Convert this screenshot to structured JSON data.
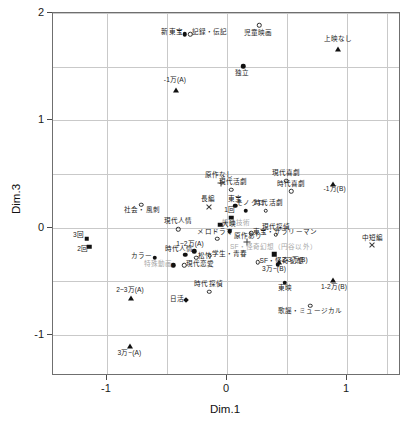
{
  "chart_data": {
    "type": "scatter",
    "title": "",
    "xlabel": "Dim.1",
    "ylabel": "Dim.3",
    "xlim": [
      -1.45,
      1.45
    ],
    "ylim": [
      -1.38,
      2.0
    ],
    "xticks": [
      -1,
      0,
      1
    ],
    "xticklabels": [
      "-1",
      "0",
      "1"
    ],
    "yticks": [
      -1,
      0,
      1,
      2
    ],
    "yticklabels": [
      "-1",
      "0",
      "1",
      "2"
    ],
    "grid": true,
    "gridlines_x": [
      -1.0,
      -0.5,
      0.0,
      0.5,
      1.0,
      1.33
    ],
    "gridlines_y": [
      -1.0,
      -0.5,
      0.0,
      0.5,
      1.0,
      1.5,
      2.0
    ],
    "legend": "none",
    "points": [
      {
        "label": "新東宝",
        "x": -0.345,
        "y": 1.795,
        "marker": "fdot",
        "anchor": "r",
        "lx": -0.36,
        "ly": 1.8
      },
      {
        "label": "記録・伝記",
        "x": -0.3,
        "y": 1.795,
        "marker": "circle",
        "anchor": "l",
        "lx": -0.285,
        "ly": 1.8
      },
      {
        "label": "児童映画",
        "x": 0.275,
        "y": 1.875,
        "marker": "circle",
        "anchor": "c",
        "lx": 0.265,
        "ly": 1.795
      },
      {
        "label": "上映なし",
        "x": 0.935,
        "y": 1.655,
        "marker": "tri",
        "anchor": "c",
        "lx": 0.935,
        "ly": 1.735
      },
      {
        "label": "独立",
        "x": 0.145,
        "y": 1.495,
        "marker": "fdot",
        "anchor": "c",
        "lx": 0.135,
        "ly": 1.425
      },
      {
        "label": "-1万(A)",
        "x": -0.42,
        "y": 1.275,
        "marker": "tri",
        "anchor": "c",
        "lx": -0.425,
        "ly": 1.355
      },
      {
        "label": "原作なし",
        "x": -0.04,
        "y": 0.41,
        "marker": "plus",
        "anchor": "c",
        "lx": -0.06,
        "ly": 0.47
      },
      {
        "label": "現代活劇",
        "x": 0.045,
        "y": 0.345,
        "marker": "circle",
        "anchor": "c",
        "lx": 0.06,
        "ly": 0.405
      },
      {
        "label": "現代喜劇",
        "x": 0.5,
        "y": 0.43,
        "marker": "circle",
        "anchor": "c",
        "lx": 0.5,
        "ly": 0.49
      },
      {
        "label": "時代喜劇",
        "x": 0.545,
        "y": 0.33,
        "marker": "circle",
        "anchor": "c",
        "lx": 0.545,
        "ly": 0.39
      },
      {
        "label": "-1万(B)",
        "x": 0.895,
        "y": 0.4,
        "marker": "tri",
        "anchor": "c",
        "lx": 0.905,
        "ly": 0.345
      },
      {
        "label": "社会・風刺",
        "x": -0.705,
        "y": 0.205,
        "marker": "circle",
        "anchor": "c",
        "lx": -0.7,
        "ly": 0.145
      },
      {
        "label": "長編",
        "x": -0.145,
        "y": 0.185,
        "marker": "cross",
        "anchor": "c",
        "lx": -0.15,
        "ly": 0.245
      },
      {
        "label": "東宝",
        "x": 0.075,
        "y": 0.195,
        "marker": "fdot",
        "anchor": "c",
        "lx": 0.072,
        "ly": 0.25
      },
      {
        "label": "モノクロ",
        "x": 0.165,
        "y": 0.15,
        "marker": "fdot",
        "anchor": "c",
        "lx": 0.205,
        "ly": 0.215
      },
      {
        "label": "時代活劇",
        "x": 0.33,
        "y": 0.15,
        "marker": "circle",
        "anchor": "c",
        "lx": 0.355,
        "ly": 0.215
      },
      {
        "label": "1回",
        "x": 0.045,
        "y": 0.085,
        "marker": "square",
        "anchor": "c",
        "lx": 0.03,
        "ly": 0.15
      },
      {
        "label": "現代人情",
        "x": -0.4,
        "y": -0.025,
        "marker": "circle",
        "anchor": "c",
        "lx": -0.4,
        "ly": 0.04
      },
      {
        "label": "特殊技術",
        "x": -0.05,
        "y": 0.02,
        "marker": "square",
        "anchor": "l",
        "lx": -0.035,
        "ly": 0.025,
        "gray": true
      },
      {
        "label": "大映",
        "x": 0.03,
        "y": -0.04,
        "marker": "fdot",
        "anchor": "c",
        "lx": 0.025,
        "ly": 0.02
      },
      {
        "label": "東宝・サラリーマン",
        "x": 0.21,
        "y": -0.06,
        "marker": "circle",
        "anchor": "l",
        "lx": 0.225,
        "ly": -0.06
      },
      {
        "label": "現代探偵",
        "x": 0.415,
        "y": -0.075,
        "marker": "circle",
        "anchor": "c",
        "lx": 0.415,
        "ly": -0.015
      },
      {
        "label": "3回",
        "x": -1.16,
        "y": -0.11,
        "marker": "square",
        "anchor": "r",
        "lx": -1.185,
        "ly": -0.085
      },
      {
        "label": "2回",
        "x": -1.14,
        "y": -0.185,
        "marker": "square",
        "anchor": "r",
        "lx": -1.15,
        "ly": -0.215
      },
      {
        "label": "メロドラマ",
        "x": -0.075,
        "y": -0.11,
        "marker": "circle",
        "anchor": "c",
        "lx": -0.09,
        "ly": -0.055
      },
      {
        "label": "原作あり",
        "x": 0.175,
        "y": -0.145,
        "marker": "plus",
        "anchor": "c",
        "lx": 0.185,
        "ly": -0.095
      },
      {
        "label": "中短編",
        "x": 1.22,
        "y": -0.165,
        "marker": "cross",
        "anchor": "c",
        "lx": 1.22,
        "ly": -0.11
      },
      {
        "label": "1~2万(A)",
        "x": -0.265,
        "y": -0.23,
        "marker": "fdot",
        "anchor": "c",
        "lx": -0.3,
        "ly": -0.165
      },
      {
        "label": "時代人情",
        "x": -0.34,
        "y": -0.26,
        "marker": "fdot",
        "anchor": "c",
        "lx": -0.39,
        "ly": -0.215
      },
      {
        "label": "松竹",
        "x": -0.25,
        "y": -0.29,
        "marker": "circle",
        "anchor": "l",
        "lx": -0.235,
        "ly": -0.28
      },
      {
        "label": "学生・青春",
        "x": -0.135,
        "y": -0.27,
        "marker": "circle",
        "anchor": "l",
        "lx": -0.12,
        "ly": -0.265
      },
      {
        "label": "カラー",
        "x": -0.595,
        "y": -0.29,
        "marker": "fdot",
        "anchor": "r",
        "lx": -0.615,
        "ly": -0.285
      },
      {
        "label": "SF・怪奇幻想（円谷以外）",
        "x": 0.4,
        "y": -0.255,
        "marker": "square",
        "anchor": "c",
        "lx": 0.395,
        "ly": -0.195,
        "gray": true
      },
      {
        "label": "SF・怪奇幻想",
        "x": 0.265,
        "y": -0.33,
        "marker": "circle",
        "anchor": "l",
        "lx": 0.28,
        "ly": -0.33
      },
      {
        "label": "2-3万(B)",
        "x": 0.445,
        "y": -0.33,
        "marker": "tri",
        "anchor": "l",
        "lx": 0.465,
        "ly": -0.315
      },
      {
        "label": "3万~(B)",
        "x": 0.43,
        "y": -0.355,
        "marker": "fdot",
        "anchor": "c",
        "lx": 0.4,
        "ly": -0.405
      },
      {
        "label": "特殊動画",
        "x": -0.44,
        "y": -0.36,
        "marker": "fdot",
        "anchor": "r",
        "lx": -0.45,
        "ly": -0.36,
        "gray": true
      },
      {
        "label": "現代恋愛",
        "x": -0.35,
        "y": -0.36,
        "marker": "circle",
        "anchor": "l",
        "lx": -0.335,
        "ly": -0.36
      },
      {
        "label": "東映",
        "x": 0.49,
        "y": -0.52,
        "marker": "fdot",
        "anchor": "c",
        "lx": 0.49,
        "ly": -0.58
      },
      {
        "label": "1-2万(B)",
        "x": 0.89,
        "y": -0.5,
        "marker": "tri",
        "anchor": "c",
        "lx": 0.9,
        "ly": -0.57
      },
      {
        "label": "2~3万(A)",
        "x": -0.79,
        "y": -0.66,
        "marker": "tri",
        "anchor": "c",
        "lx": -0.8,
        "ly": -0.595
      },
      {
        "label": "時代探偵",
        "x": -0.14,
        "y": -0.605,
        "marker": "circle",
        "anchor": "c",
        "lx": -0.145,
        "ly": -0.545
      },
      {
        "label": "日活",
        "x": -0.33,
        "y": -0.685,
        "marker": "diamond",
        "anchor": "r",
        "lx": -0.35,
        "ly": -0.68
      },
      {
        "label": "歌謡・ミュージカル",
        "x": 0.7,
        "y": -0.735,
        "marker": "circle",
        "anchor": "c",
        "lx": 0.7,
        "ly": -0.79
      },
      {
        "label": "3万~(A)",
        "x": -0.8,
        "y": -1.11,
        "marker": "tri",
        "anchor": "c",
        "lx": -0.805,
        "ly": -1.18
      }
    ]
  }
}
